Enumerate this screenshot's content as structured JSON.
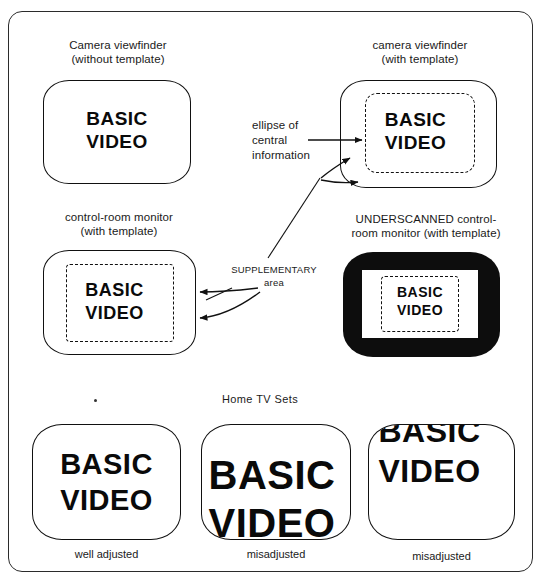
{
  "figure": {
    "screen_text_line1": "BASIC",
    "screen_text_line2": "VIDEO"
  },
  "labels": {
    "camera_viewfinder_without": "Camera viewfinder\n(without template)",
    "camera_viewfinder_with": "camera viewfinder\n(with template)",
    "control_room_monitor": "control-room monitor\n(with template)",
    "underscanned_monitor": "UNDERSCANNED control-\nroom monitor (with template)",
    "home_tv_sets": "Home TV Sets"
  },
  "annotations": {
    "ellipse_of_central_information": "ellipse of\ncentral\ninformation",
    "supplementary_area": "SUPPLEMENTARY\narea"
  },
  "captions": {
    "tv1": "well adjusted",
    "tv2": "misadjusted",
    "tv3": "misadjusted"
  },
  "colors": {
    "frame_stroke": "#2b2b2b",
    "screen_stroke": "#111111",
    "monitor_fill": "#0d0d0d",
    "text": "#1a1a1a",
    "background": "#ffffff"
  }
}
